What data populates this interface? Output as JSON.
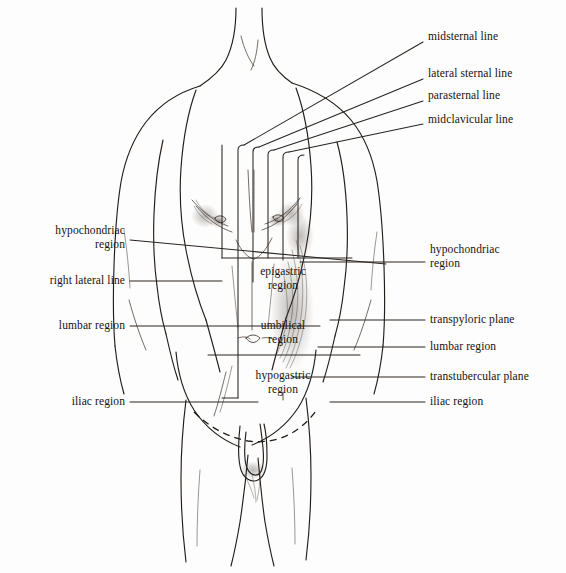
{
  "figure": {
    "background_color": "#fdfdfd",
    "ink_color": "#17120e"
  },
  "labels": {
    "top_right": [
      {
        "id": "midsternal-line",
        "text": "midsternal line",
        "x": 428,
        "y": 36,
        "anchor": "left"
      },
      {
        "id": "lateral-sternal-line",
        "text": "lateral sternal line",
        "x": 428,
        "y": 73,
        "anchor": "left"
      },
      {
        "id": "parasternal-line",
        "text": "parasternal line",
        "x": 428,
        "y": 95,
        "anchor": "left"
      },
      {
        "id": "midclavicular-line",
        "text": "midclavicular line",
        "x": 428,
        "y": 119,
        "anchor": "left"
      }
    ],
    "left": [
      {
        "id": "hypochondriac-region-left",
        "text": "hypochondriac\nregion",
        "x": 125,
        "y": 230,
        "anchor": "right"
      },
      {
        "id": "right-lateral-line",
        "text": "right lateral line",
        "x": 125,
        "y": 278,
        "anchor": "right"
      },
      {
        "id": "lumbar-region-left",
        "text": "lumbar region",
        "x": 125,
        "y": 323,
        "anchor": "right"
      },
      {
        "id": "iliac-region-left",
        "text": "iliac region",
        "x": 125,
        "y": 399,
        "anchor": "right"
      }
    ],
    "right": [
      {
        "id": "hypochondriac-region-right",
        "text": "hypochondriac\nregion",
        "x": 430,
        "y": 249,
        "anchor": "left"
      },
      {
        "id": "transpyloric-plane",
        "text": "transpyloric plane",
        "x": 430,
        "y": 317,
        "anchor": "left"
      },
      {
        "id": "lumbar-region-right",
        "text": "lumbar region",
        "x": 430,
        "y": 344,
        "anchor": "left"
      },
      {
        "id": "transtubercular-plane",
        "text": "transtubercular plane",
        "x": 430,
        "y": 374,
        "anchor": "left"
      },
      {
        "id": "iliac-region-right",
        "text": "iliac region",
        "x": 430,
        "y": 399,
        "anchor": "left"
      }
    ],
    "center": [
      {
        "id": "epigastric-region",
        "text": "epigastric\nregion",
        "x": 283,
        "y": 271,
        "anchor": "center"
      },
      {
        "id": "umbilical-region",
        "text": "umbilical\nregion",
        "x": 283,
        "y": 325,
        "anchor": "center"
      },
      {
        "id": "hypogastric-region",
        "text": "hypogastric\nregion",
        "x": 283,
        "y": 375,
        "anchor": "center"
      }
    ]
  },
  "vertical_lines": [
    {
      "id": "midsternal-line",
      "x": 238,
      "top": 145,
      "bottom": 398
    },
    {
      "id": "lateral-sternal-line",
      "x": 253,
      "top": 147,
      "bottom": 282
    },
    {
      "id": "parasternal-line",
      "x": 268,
      "top": 150,
      "bottom": 258
    },
    {
      "id": "midclavicular-line",
      "x": 283,
      "top": 152,
      "bottom": 260
    }
  ],
  "transverse_planes": [
    {
      "id": "transpyloric-plane",
      "y": 258,
      "x1": 222,
      "x2": 352
    },
    {
      "id": "transtubercular-plane",
      "y": 355,
      "x1": 208,
      "x2": 360
    }
  ],
  "colors": {
    "ink": "#17120e",
    "line": "#2a2420",
    "shading": "#54493f",
    "background": "#fdfdfd"
  }
}
